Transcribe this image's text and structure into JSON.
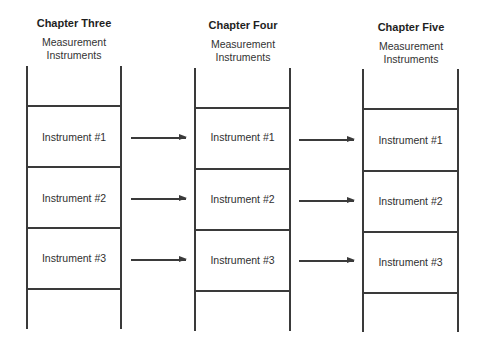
{
  "diagram": {
    "type": "ladder-progression",
    "colors": {
      "line": "#3a3a3a",
      "text": "#2a2a2a",
      "background": "#ffffff"
    },
    "ladders": [
      {
        "title": "Chapter Three",
        "subtitle_line1": "Measurement",
        "subtitle_line2": "Instruments",
        "cells": [
          {
            "label": "Instrument #1"
          },
          {
            "label": "Instrument #2"
          },
          {
            "label": "Instrument #3"
          }
        ]
      },
      {
        "title": "Chapter Four",
        "subtitle_line1": "Measurement",
        "subtitle_line2": "Instruments",
        "cells": [
          {
            "label": "Instrument #1"
          },
          {
            "label": "Instrument #2"
          },
          {
            "label": "Instrument #3"
          }
        ]
      },
      {
        "title": "Chapter Five",
        "subtitle_line1": "Measurement",
        "subtitle_line2": "Instruments",
        "cells": [
          {
            "label": "Instrument #1"
          },
          {
            "label": "Instrument #2"
          },
          {
            "label": "Instrument #3"
          }
        ]
      }
    ],
    "arrows": [
      {
        "from": "Chapter Three / Instrument #1",
        "to": "Chapter Four / Instrument #1"
      },
      {
        "from": "Chapter Three / Instrument #2",
        "to": "Chapter Four / Instrument #2"
      },
      {
        "from": "Chapter Three / Instrument #3",
        "to": "Chapter Four / Instrument #3"
      },
      {
        "from": "Chapter Four / Instrument #1",
        "to": "Chapter Five / Instrument #1"
      },
      {
        "from": "Chapter Four / Instrument #2",
        "to": "Chapter Five / Instrument #2"
      },
      {
        "from": "Chapter Four / Instrument #3",
        "to": "Chapter Five / Instrument #3"
      }
    ]
  }
}
